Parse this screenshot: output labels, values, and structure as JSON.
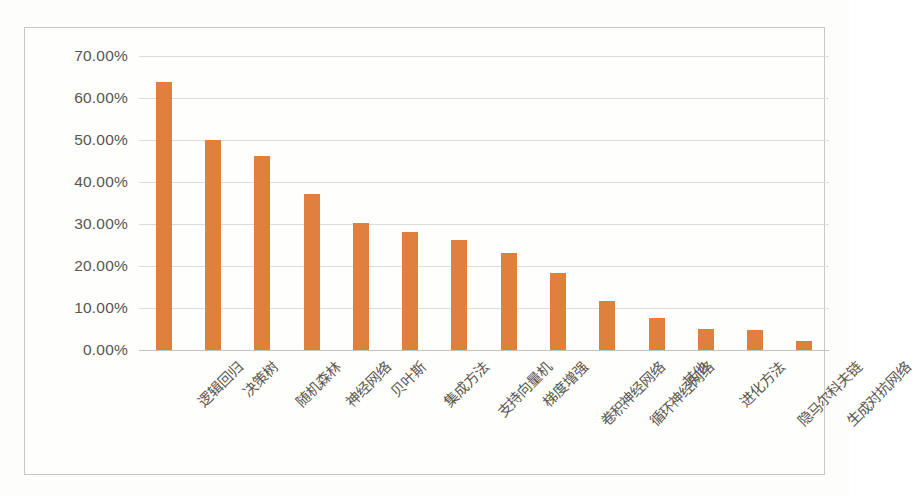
{
  "chart_data": {
    "type": "bar",
    "title": "",
    "subtitle": "",
    "xlabel": "",
    "ylabel": "",
    "ylim": [
      0,
      70
    ],
    "grid": true,
    "legend": "none",
    "orientation": "vertical",
    "value_suffix": "%",
    "bar_color": "#e0803d",
    "gridline_color": "#dcdcd8",
    "axis_color": "#c4c4be",
    "tick_label_color": "#58564f",
    "y_ticks": [
      "70.00%",
      "60.00%",
      "50.00%",
      "40.00%",
      "30.00%",
      "20.00%",
      "10.00%",
      "0.00%"
    ],
    "y_tick_values": [
      70,
      60,
      50,
      40,
      30,
      20,
      10,
      0
    ],
    "categories": [
      "逻辑回归",
      "决策树",
      "随机森林",
      "神经网络",
      "贝叶斯",
      "集成方法",
      "支持向量机",
      "梯度增强",
      "卷积神经网络",
      "循环神经网络",
      "其他",
      "进化方法",
      "隐马尔科夫链",
      "生成对抗网络"
    ],
    "values": [
      63.7,
      50.0,
      46.2,
      37.1,
      30.2,
      28.2,
      26.3,
      23.2,
      18.4,
      11.6,
      7.6,
      4.9,
      4.7,
      2.1
    ]
  }
}
